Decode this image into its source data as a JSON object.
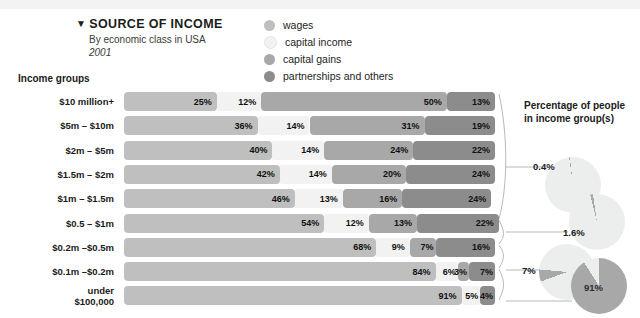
{
  "header": {
    "caret": "▼",
    "title": "SOURCE OF INCOME",
    "subtitle": "By economic class in USA",
    "year": "2001",
    "groups_header": "Income groups"
  },
  "legend": {
    "items": [
      {
        "label": "wages",
        "color": "#bfbfbf"
      },
      {
        "label": "capital income",
        "color": "#f2f2f2"
      },
      {
        "label": "capital gains",
        "color": "#a8a8a8"
      },
      {
        "label": "partnerships and others",
        "color": "#8c8c8c"
      }
    ]
  },
  "right_panel": {
    "header_line1": "Percentage of people",
    "header_line2": "in income group(s)",
    "pies": [
      {
        "label": "0.4%",
        "value": 0.4,
        "inner_label": ""
      },
      {
        "label": "1.6%",
        "value": 1.6,
        "inner_label": ""
      },
      {
        "label": "7%",
        "value": 7,
        "inner_label": ""
      },
      {
        "label": "91%",
        "value": 91,
        "inner_label": "91%"
      }
    ]
  },
  "chart_data": {
    "type": "bar",
    "title": "SOURCE OF INCOME",
    "subtitle": "By economic class in USA",
    "year": "2001",
    "xlabel": "",
    "ylabel": "Income groups",
    "stacked": true,
    "normalized_percent": true,
    "xlim": [
      0,
      100
    ],
    "grid": false,
    "legend_position": "top-right",
    "series": [
      {
        "name": "wages",
        "color": "#bfbfbf",
        "values": [
          25,
          36,
          40,
          42,
          46,
          54,
          68,
          84,
          91
        ]
      },
      {
        "name": "capital income",
        "color": "#f2f2f2",
        "values": [
          12,
          14,
          14,
          14,
          13,
          12,
          9,
          6,
          5
        ]
      },
      {
        "name": "capital gains",
        "color": "#a8a8a8",
        "values": [
          50,
          31,
          24,
          20,
          16,
          13,
          7,
          3,
          0
        ]
      },
      {
        "name": "partnerships and others",
        "color": "#8c8c8c",
        "values": [
          13,
          19,
          22,
          24,
          24,
          22,
          16,
          7,
          4
        ]
      }
    ],
    "categories": [
      "$10 million+",
      "$5m – $10m",
      "$2m – $5m",
      "$1.5m – $2m",
      "$1m – $1.5m",
      "$0.5 – $1m",
      "$0.2m –$0.5m",
      "$0.1m –$0.2m",
      "under\n$100,000"
    ],
    "rows": [
      {
        "label": "$10 million+",
        "label_lines": [
          "$10 million+"
        ],
        "segments": [
          25,
          12,
          50,
          13
        ]
      },
      {
        "label": "$5m – $10m",
        "label_lines": [
          "$5m – $10m"
        ],
        "segments": [
          36,
          14,
          31,
          19
        ]
      },
      {
        "label": "$2m – $5m",
        "label_lines": [
          "$2m – $5m"
        ],
        "segments": [
          40,
          14,
          24,
          22
        ]
      },
      {
        "label": "$1.5m – $2m",
        "label_lines": [
          "$1.5m – $2m"
        ],
        "segments": [
          42,
          14,
          20,
          24
        ]
      },
      {
        "label": "$1m – $1.5m",
        "label_lines": [
          "$1m – $1.5m"
        ],
        "segments": [
          46,
          13,
          16,
          24
        ]
      },
      {
        "label": "$0.5 – $1m",
        "label_lines": [
          "$0.5 – $1m"
        ],
        "segments": [
          54,
          12,
          13,
          22
        ]
      },
      {
        "label": "$0.2m –$0.5m",
        "label_lines": [
          "$0.2m –$0.5m"
        ],
        "segments": [
          68,
          9,
          7,
          16
        ]
      },
      {
        "label": "$0.1m –$0.2m",
        "label_lines": [
          "$0.1m –$0.2m"
        ],
        "segments": [
          84,
          6,
          3,
          7
        ]
      },
      {
        "label": "under $100,000",
        "label_lines": [
          "under",
          "$100,000"
        ],
        "segments": [
          91,
          5,
          0,
          4
        ]
      }
    ],
    "annotations": [
      {
        "text": "0.4%",
        "refers_to_rows": [
          "$10 million+",
          "$5m – $10m",
          "$2m – $5m",
          "$1.5m – $2m",
          "$1m – $1.5m",
          "$0.5 – $1m"
        ]
      },
      {
        "text": "1.6%",
        "refers_to_rows": [
          "$0.2m –$0.5m"
        ]
      },
      {
        "text": "7%",
        "refers_to_rows": [
          "$0.1m –$0.2m"
        ]
      },
      {
        "text": "91%",
        "refers_to_rows": [
          "under $100,000"
        ]
      }
    ]
  }
}
